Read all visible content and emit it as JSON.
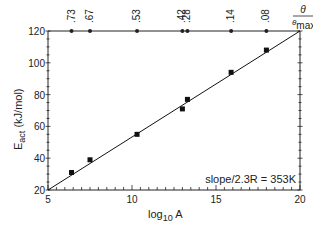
{
  "chart_data": {
    "type": "scatter",
    "title": "",
    "xlabel": "log10 A",
    "ylabel": "E_act (kJ/mol)",
    "xlim": [
      5,
      20
    ],
    "ylim": [
      20,
      120
    ],
    "xticks": [
      5,
      10,
      15,
      20
    ],
    "yticks": [
      20,
      40,
      60,
      80,
      100,
      120
    ],
    "grid": false,
    "series": [
      {
        "name": "data",
        "marker": "square",
        "x": [
          6.4,
          7.5,
          10.3,
          13.0,
          13.3,
          15.9,
          18.0
        ],
        "y": [
          31,
          39,
          55,
          71,
          77,
          94,
          108
        ]
      },
      {
        "name": "fit",
        "type": "line",
        "x": [
          5,
          20
        ],
        "y": [
          20,
          120
        ]
      }
    ],
    "top_axis": {
      "label_main": "θ",
      "label_sub": "θmax",
      "markers_x": [
        6.4,
        7.5,
        10.3,
        13.0,
        13.3,
        15.9,
        18.0
      ],
      "labels": [
        ".73",
        ".67",
        ".53",
        ".42",
        ".28",
        ".14",
        ".08"
      ]
    },
    "annotation": "slope/2.3R = 353K"
  },
  "labels": {
    "x_axis_main": "log",
    "x_axis_sub": "10",
    "x_axis_tail": " A",
    "y_axis_main": "E",
    "y_axis_sub": "act",
    "y_axis_tail": " (kJ/mol)",
    "annotation": "slope/2.3R = 353K",
    "theta": "θ",
    "theta_max_main": "θ",
    "theta_max_sub": "max"
  }
}
